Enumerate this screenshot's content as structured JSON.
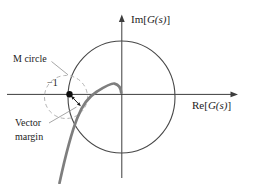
{
  "figure": {
    "type": "nyquist-vector-margin-diagram",
    "axis_labels": {
      "im": {
        "pre": "Im[",
        "sym": "G(s)",
        "post": "]"
      },
      "re": {
        "pre": "Re[",
        "sym": "G(s)",
        "post": "]"
      }
    },
    "annotations": {
      "m_circle": "M circle",
      "minus_one_point": "−1",
      "vector_margin": {
        "line1": "Vector",
        "line2": "margin"
      }
    },
    "colors": {
      "background": "#ffffff",
      "axis": "#3d3d3d",
      "unit_circle": "#474747",
      "m_circle_dashed": "#b4b4b4",
      "nyquist_curve": "#7e7e7e",
      "leader_line": "#9c9c9c",
      "arrow": "#1a1a1a",
      "point": "#0d0d0d",
      "text": "#1c1c1c"
    }
  }
}
